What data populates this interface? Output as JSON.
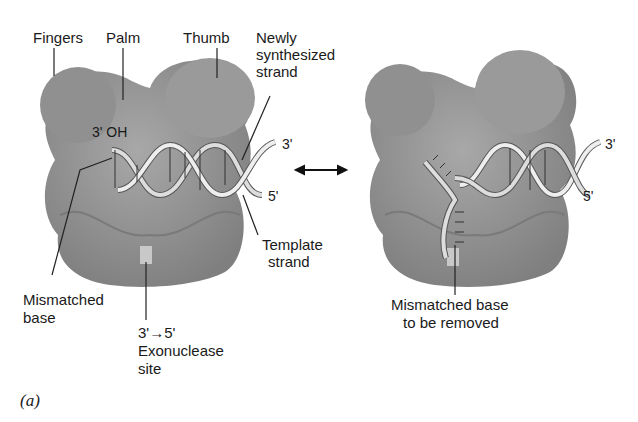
{
  "figure": {
    "panel_label": "(a)",
    "left_panel": {
      "labels": {
        "fingers": "Fingers",
        "palm": "Palm",
        "thumb": "Thumb",
        "newly_line1": "Newly",
        "newly_line2": "synthesized",
        "newly_line3": "strand",
        "three_oh": "3' OH",
        "three_prime": "3'",
        "five_prime": "5'",
        "template_line1": "Template",
        "template_line2": "strand",
        "mismatched_line1": "Mismatched",
        "mismatched_line2": "base",
        "exo_line1": "3'→5'",
        "exo_line2": "Exonuclease",
        "exo_line3": "site"
      }
    },
    "right_panel": {
      "labels": {
        "three_prime": "3'",
        "five_prime": "5'",
        "removed_line1": "Mismatched base",
        "removed_line2": "to be removed"
      }
    },
    "colors": {
      "protein": "#8c8c8c",
      "protein_light": "#a5a5a5",
      "exo_site": "#c8c8c8",
      "dna": "#d9d9d9",
      "line": "#1a1a1a"
    }
  }
}
